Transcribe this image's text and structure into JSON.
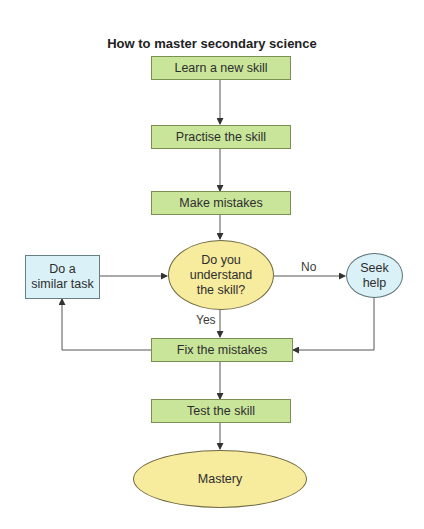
{
  "title": "How to master secondary science",
  "nodes": {
    "learn": "Learn a new skill",
    "practise": "Practise the skill",
    "mistakes": "Make mistakes",
    "decision": "Do you understand the skill?",
    "seek": "Seek help",
    "similar": "Do a similar task",
    "fix": "Fix the mistakes",
    "test": "Test the skill",
    "mastery": "Mastery"
  },
  "edge_labels": {
    "no": "No",
    "yes": "Yes"
  },
  "colors": {
    "process_fill": "#c9e59a",
    "decision_fill": "#f7eb9d",
    "side_fill": "#daf1f8"
  }
}
